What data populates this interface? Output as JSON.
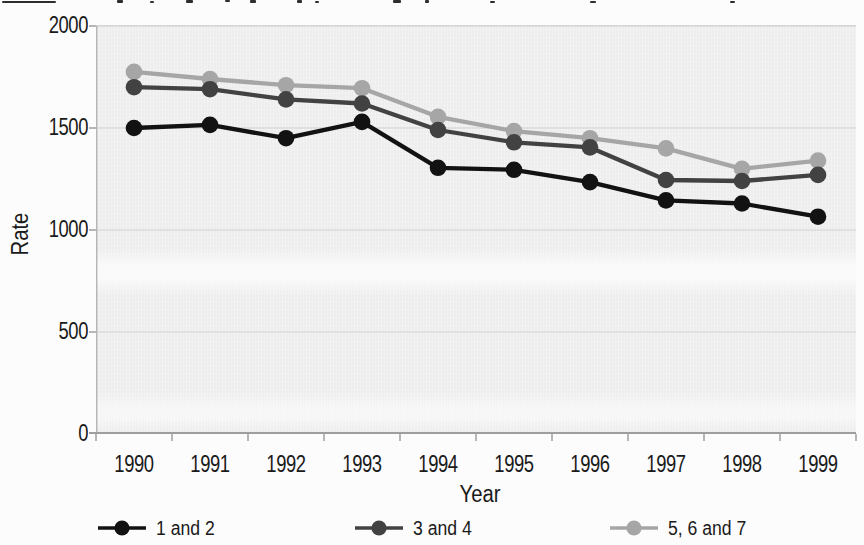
{
  "chart_data": {
    "type": "line",
    "title": "",
    "xlabel": "Year",
    "ylabel": "Rate",
    "categories": [
      "1990",
      "1991",
      "1992",
      "1993",
      "1994",
      "1995",
      "1996",
      "1997",
      "1998",
      "1999"
    ],
    "series": [
      {
        "name": "1 and 2",
        "color": "#121212",
        "values": [
          1500,
          1515,
          1450,
          1530,
          1305,
          1295,
          1235,
          1145,
          1130,
          1065
        ]
      },
      {
        "name": "3 and 4",
        "color": "#424242",
        "values": [
          1700,
          1690,
          1640,
          1620,
          1490,
          1430,
          1405,
          1245,
          1240,
          1270
        ]
      },
      {
        "name": "5, 6 and 7",
        "color": "#a6a6a6",
        "values": [
          1775,
          1740,
          1710,
          1695,
          1555,
          1485,
          1450,
          1400,
          1300,
          1340
        ]
      }
    ],
    "ylim": [
      0,
      2000
    ],
    "yticks": [
      0,
      500,
      1000,
      1500,
      2000
    ],
    "ytick_labels": [
      "0",
      "500",
      "1000",
      "1500",
      "2000"
    ],
    "grid": true,
    "legend_position": "bottom",
    "plot_background": "#ededed",
    "gridline_color": "#d2d2d2",
    "axis_text_color": "#1a1a1a"
  }
}
